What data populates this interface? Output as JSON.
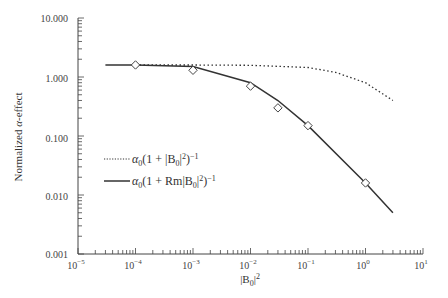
{
  "chart_data": {
    "type": "line",
    "title": "",
    "xlabel": "|B0|^2",
    "ylabel": "Normalized α-effect",
    "xscale": "log",
    "yscale": "log",
    "xlim": [
      1e-05,
      10
    ],
    "ylim": [
      0.001,
      10
    ],
    "grid": false,
    "legend_position": "lower-left inside",
    "x_tick_labels": [
      "10^-5",
      "10^-4",
      "10^-3",
      "10^-2",
      "10^-1",
      "10^0",
      "10^1"
    ],
    "y_tick_labels": [
      "0.001",
      "0.010",
      "0.100",
      "1.000",
      "10.000"
    ],
    "series": [
      {
        "name": "α0(1 + |B0|^2)^-1",
        "style": "dotted",
        "x": [
          0.0001,
          0.001,
          0.01,
          0.1,
          0.3,
          1,
          3
        ],
        "values": [
          1.6,
          1.6,
          1.58,
          1.45,
          1.2,
          0.8,
          0.4
        ]
      },
      {
        "name": "α0(1 + Rm|B0|^2)^-1",
        "style": "solid",
        "x": [
          3e-05,
          0.0001,
          0.001,
          0.01,
          0.03,
          0.1,
          1,
          3
        ],
        "values": [
          1.6,
          1.6,
          1.5,
          0.8,
          0.4,
          0.15,
          0.016,
          0.005
        ]
      },
      {
        "name": "simulation data",
        "style": "markers-diamond",
        "x": [
          0.0001,
          0.001,
          0.01,
          0.03,
          0.1,
          1
        ],
        "values": [
          1.6,
          1.3,
          0.7,
          0.3,
          0.15,
          0.016
        ]
      }
    ]
  },
  "axes": {
    "y_ticks": [
      {
        "label": "10.000",
        "y": 18
      },
      {
        "label": "1.000",
        "y": 78
      },
      {
        "label": "0.100",
        "y": 138
      },
      {
        "label": "0.010",
        "y": 196
      },
      {
        "label": "0.001",
        "y": 254
      }
    ],
    "x_ticks": [
      {
        "base": "10",
        "exp": "−5",
        "x": 78
      },
      {
        "base": "10",
        "exp": "−4",
        "x": 135
      },
      {
        "base": "10",
        "exp": "−3",
        "x": 193
      },
      {
        "base": "10",
        "exp": "−2",
        "x": 250
      },
      {
        "base": "10",
        "exp": "−1",
        "x": 308
      },
      {
        "base": "10",
        "exp": "0",
        "x": 365
      },
      {
        "base": "10",
        "exp": "1",
        "x": 423
      }
    ],
    "x_title": {
      "prefix": "|B",
      "sub": "0",
      "suffix": "|",
      "sup": "2"
    },
    "y_title": {
      "pre": "Normalized ",
      "greek": "α",
      "post": "-effect"
    }
  },
  "legend": {
    "items": [
      {
        "style": "dotted",
        "alpha": "α",
        "sub": "0",
        "body": "(1 + |B",
        "sub2": "0",
        "tail": "|",
        "sup1": "2",
        "close": ")",
        "sup2": "−1"
      },
      {
        "style": "solid",
        "alpha": "α",
        "sub": "0",
        "body": "(1 + Rm|B",
        "sub2": "0",
        "tail": "|",
        "sup1": "2",
        "close": ")",
        "sup2": "−1"
      }
    ]
  },
  "colors": {
    "line": "#333333",
    "axis": "#444444",
    "marker_fill": "#ffffff"
  }
}
